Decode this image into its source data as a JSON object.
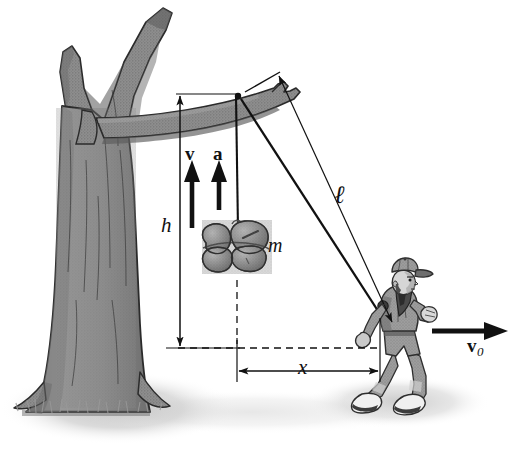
{
  "figure": {
    "background_color": "#ffffff",
    "ink_color": "#111111",
    "tree_fill": "#8e8e8e",
    "tree_shade": "#6f6f6f",
    "tree_outline": "#2b2b2b",
    "ground_shadow": "#cfcfcf",
    "person_fill": "#9a9a9a",
    "person_dark": "#4a4a4a",
    "mass_fill": "#8a8a8a"
  },
  "labels": {
    "height": "h",
    "mass": "m",
    "distance": "x",
    "rope_length": "ℓ",
    "velocity_vector": "v",
    "acceleration_vector": "a",
    "initial_velocity": "v",
    "initial_velocity_subscript": "0"
  },
  "objects": {
    "tree": "tree",
    "branch": "horizontal-branch",
    "rope": "rope",
    "mass_bundle": "hanging-mass-bundle",
    "person": "walking-person",
    "ground": "ground-shadow"
  },
  "annotations": {
    "h_dimension": "vertical double-headed dimension arrow for h",
    "x_dimension": "horizontal double-headed dimension arrow for x",
    "l_dimension": "diagonal double-headed dimension arrow for rope length",
    "v_arrow": "upward arrow labeled v",
    "a_arrow": "upward arrow labeled a",
    "v0_arrow": "rightward arrow labeled v-zero",
    "vertical_dashed": "vertical dashed reference line below mass",
    "horizontal_dashed": "horizontal dashed reference line at base level"
  }
}
